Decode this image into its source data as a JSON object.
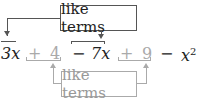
{
  "labels": {
    "top": "like terms",
    "bottom": "like terms"
  },
  "expression": {
    "t1": "3x",
    "op1": "+",
    "t2": "4",
    "op2": "−",
    "t3": "7x",
    "op3": "+",
    "t4": "9",
    "op4": "−",
    "t5_base": "x",
    "t5_exp": "2"
  },
  "colors": {
    "dark": "#222222",
    "grey": "#aaaaaa"
  }
}
